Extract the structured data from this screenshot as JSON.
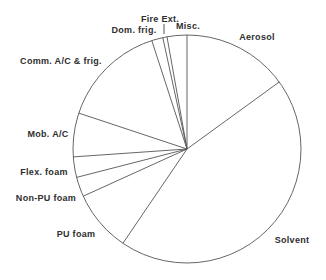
{
  "figure": {
    "background_color": "#ffffff",
    "line_color": "#555555",
    "text_color": "#2e2e2e"
  },
  "chart_data": {
    "type": "pie",
    "title": "",
    "unit": "percent",
    "style": "outline-only, no fill, black and white",
    "start_angle_deg": 90,
    "direction": "clockwise",
    "center_px": {
      "x": 187,
      "y": 149
    },
    "radius_px": 114,
    "slices": [
      {
        "label": "Aerosol",
        "value": 15.0
      },
      {
        "label": "Solvent",
        "value": 44.5
      },
      {
        "label": "PU foam",
        "value": 8.7
      },
      {
        "label": "Non-PU foam",
        "value": 2.8
      },
      {
        "label": "Flex. foam",
        "value": 2.9
      },
      {
        "label": "Mob. A/C",
        "value": 6.2
      },
      {
        "label": "Comm. A/C & frig.",
        "value": 14.9
      },
      {
        "label": "Dom. frig.",
        "value": 1.6
      },
      {
        "label": "Fire Ext.",
        "value": 0.6
      },
      {
        "label": "Misc.",
        "value": 2.8
      }
    ],
    "labels_pos": [
      {
        "text": "Aerosol",
        "x": 257,
        "y": 37
      },
      {
        "text": "Solvent",
        "x": 292,
        "y": 240
      },
      {
        "text": "PU foam",
        "x": 76,
        "y": 234
      },
      {
        "text": "Non-PU foam",
        "x": 46,
        "y": 198
      },
      {
        "text": "Flex. foam",
        "x": 44,
        "y": 172
      },
      {
        "text": "Mob. A/C",
        "x": 48,
        "y": 134
      },
      {
        "text": "Comm. A/C & frig.",
        "x": 61,
        "y": 61
      },
      {
        "text": "Dom. frig.",
        "x": 134,
        "y": 30
      },
      {
        "text": "Fire Ext.",
        "x": 160,
        "y": 19
      },
      {
        "text": "Misc.",
        "x": 188,
        "y": 26
      }
    ],
    "leader_lines": [
      {
        "for": "Fire Ext.",
        "x1": 164,
        "y1": 24,
        "x2": 164,
        "y2": 34
      }
    ],
    "legend": "none",
    "grid": "off"
  }
}
